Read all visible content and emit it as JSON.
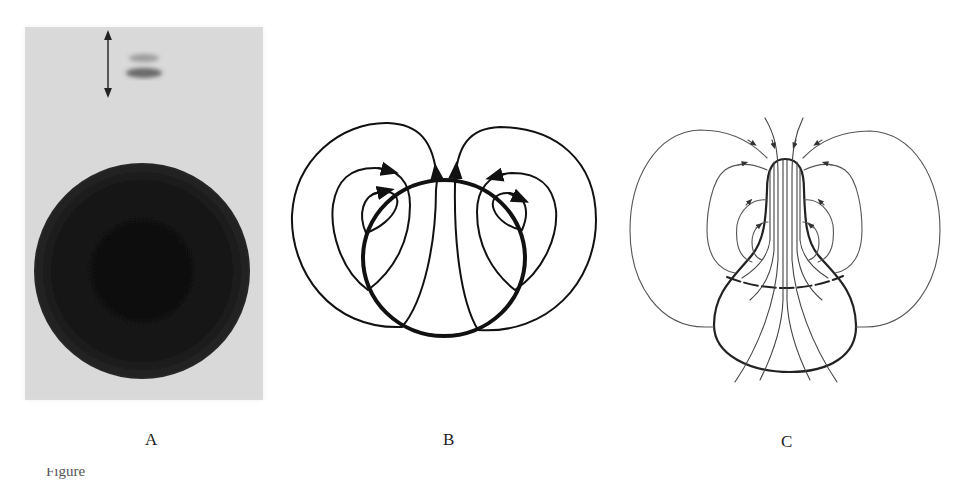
{
  "figure": {
    "panels": [
      {
        "id": "A",
        "label": "A",
        "kind": "photograph",
        "description": "Gray photographic plate with a large dark circular disk and a faint double spot beside a vertical double-headed arrow"
      },
      {
        "id": "B",
        "label": "B",
        "kind": "line-drawing",
        "description": "Thick circle with flow/field lines looping over it, arrowheads indicating direction"
      },
      {
        "id": "C",
        "label": "C",
        "kind": "line-drawing",
        "description": "Pear-shaped outline with a dashed equator and converging field lines exiting the narrow top, arrowheads indicating direction"
      }
    ],
    "caption_partial": "Figure"
  },
  "colors": {
    "photo_background": "#dcdcdc",
    "photo_disk": "#141414",
    "line": "#111111",
    "line_thin": "#555555"
  }
}
